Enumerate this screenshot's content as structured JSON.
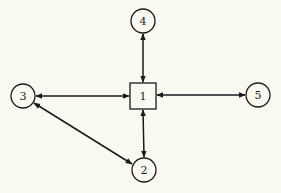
{
  "diagram": {
    "background": "#fbfaf2",
    "stroke_color": "#1a1a1a",
    "nodes": [
      {
        "id": "1",
        "label": "1",
        "shape": "square",
        "cx": 143,
        "cy": 96,
        "size": 26
      },
      {
        "id": "2",
        "label": "2",
        "shape": "circle",
        "cx": 144,
        "cy": 170,
        "r": 12
      },
      {
        "id": "3",
        "label": "3",
        "shape": "circle",
        "cx": 23,
        "cy": 96,
        "r": 12
      },
      {
        "id": "4",
        "label": "4",
        "shape": "circle",
        "cx": 143,
        "cy": 21,
        "r": 12
      },
      {
        "id": "5",
        "label": "5",
        "shape": "circle",
        "cx": 258,
        "cy": 95,
        "r": 12
      }
    ],
    "edges": [
      {
        "from": "1",
        "to": "4",
        "direction": "bidirectional"
      },
      {
        "from": "1",
        "to": "3",
        "direction": "bidirectional"
      },
      {
        "from": "1",
        "to": "5",
        "direction": "bidirectional"
      },
      {
        "from": "1",
        "to": "2",
        "direction": "bidirectional"
      },
      {
        "from": "3",
        "to": "2",
        "direction": "bidirectional"
      }
    ]
  }
}
